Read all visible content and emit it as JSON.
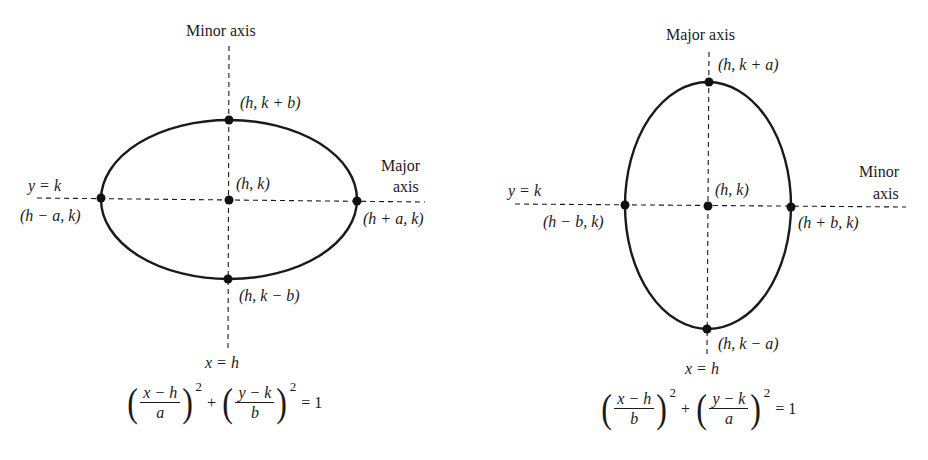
{
  "diagrams": [
    {
      "id": "horizontal-ellipse",
      "axis_top_label": "Minor axis",
      "axis_right_label_line1": "Major",
      "axis_right_label_line2": "axis",
      "horizontal_line_label": "y = k",
      "vertical_line_label": "x = h",
      "points": {
        "center": "(h, k)",
        "top": "(h, k + b)",
        "bottom": "(h, k − b)",
        "left": "(h − a, k)",
        "right": "(h + a, k)"
      },
      "equation": {
        "term1_numerator": "x − h",
        "term1_denominator": "a",
        "term2_numerator": "y − k",
        "term2_denominator": "b",
        "exponent": "2",
        "plus": "+",
        "rhs": "= 1"
      },
      "geometry": {
        "cx": 229,
        "cy": 199,
        "rx": 128,
        "ry": 79
      }
    },
    {
      "id": "vertical-ellipse",
      "axis_top_label": "Major axis",
      "axis_right_label_line1": "Minor",
      "axis_right_label_line2": "axis",
      "horizontal_line_label": "y = k",
      "vertical_line_label": "x = h",
      "points": {
        "center": "(h, k)",
        "top": "(h, k + a)",
        "bottom": "(h, k − a)",
        "left": "(h − b, k)",
        "right": "(h + b, k)"
      },
      "equation": {
        "term1_numerator": "x − h",
        "term1_denominator": "b",
        "term2_numerator": "y − k",
        "term2_denominator": "a",
        "exponent": "2",
        "plus": "+",
        "rhs": "= 1"
      },
      "geometry": {
        "cx": 708,
        "cy": 206,
        "rx": 83,
        "ry": 123
      }
    }
  ],
  "colors": {
    "stroke": "#1a1a1a",
    "background": "#ffffff"
  }
}
